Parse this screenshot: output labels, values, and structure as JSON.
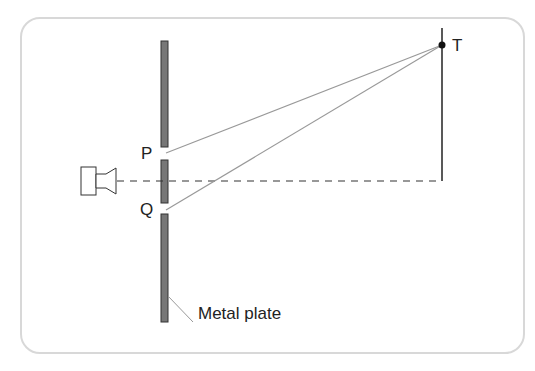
{
  "diagram": {
    "labels": {
      "P": "P",
      "Q": "Q",
      "T": "T",
      "plate": "Metal plate"
    },
    "colors": {
      "plate_fill": "#777777",
      "ray": "#999999",
      "line": "#222222",
      "frame": "#d8d8d8"
    }
  }
}
